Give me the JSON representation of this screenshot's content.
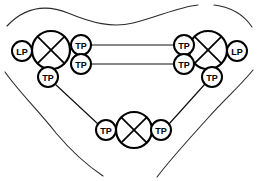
{
  "diagram": {
    "colors": {
      "background": "#ffffff",
      "node_stroke": "#000000",
      "link_stroke": "#111111",
      "boundary_stroke": "#2b2b2b"
    },
    "labels": {
      "lp": "LP",
      "tp": "TP"
    },
    "big_nodes": [
      {
        "id": "node-left",
        "cx": 51,
        "cy": 50,
        "r": 19,
        "icon": "crossed-circle-icon"
      },
      {
        "id": "node-right",
        "cx": 208,
        "cy": 50,
        "r": 19,
        "icon": "crossed-circle-icon"
      },
      {
        "id": "node-bottom",
        "cx": 134,
        "cy": 130,
        "r": 18,
        "icon": "crossed-circle-icon"
      }
    ],
    "small_nodes": [
      {
        "id": "lp-left",
        "label": "LP",
        "cx": 22,
        "cy": 51,
        "r": 10
      },
      {
        "id": "lp-right",
        "label": "LP",
        "cx": 237,
        "cy": 51,
        "r": 10
      },
      {
        "id": "tp-left-upper",
        "label": "TP",
        "cx": 81,
        "cy": 45,
        "r": 10
      },
      {
        "id": "tp-left-lower",
        "label": "TP",
        "cx": 81,
        "cy": 64,
        "r": 10
      },
      {
        "id": "tp-left-down",
        "label": "TP",
        "cx": 48,
        "cy": 77,
        "r": 10
      },
      {
        "id": "tp-right-upper",
        "label": "TP",
        "cx": 184,
        "cy": 45,
        "r": 10
      },
      {
        "id": "tp-right-lower",
        "label": "TP",
        "cx": 184,
        "cy": 64,
        "r": 10
      },
      {
        "id": "tp-right-down",
        "label": "TP",
        "cx": 212,
        "cy": 77,
        "r": 10
      },
      {
        "id": "tp-bottom-left",
        "label": "TP",
        "cx": 106,
        "cy": 130,
        "r": 10
      },
      {
        "id": "tp-bottom-right",
        "label": "TP",
        "cx": 161,
        "cy": 130,
        "r": 10
      }
    ],
    "links": [
      {
        "id": "link-top",
        "x1": 91,
        "y1": 45,
        "x2": 174,
        "y2": 45
      },
      {
        "id": "link-bottom",
        "x1": 91,
        "y1": 64,
        "x2": 174,
        "y2": 64
      },
      {
        "id": "link-left-diag",
        "x1": 55,
        "y1": 84,
        "x2": 98,
        "y2": 124
      },
      {
        "id": "link-right-diag",
        "x1": 205,
        "y1": 84,
        "x2": 169,
        "y2": 124
      }
    ],
    "boundaries": [
      {
        "id": "boundary-top-left",
        "d": "M 7 26 C 26 6 48 5 68 13 C 92 23 112 28 133 23 C 158 17 178 7 198 5"
      },
      {
        "id": "boundary-top-right",
        "d": "M 214 5 C 231 7 244 15 252 27"
      },
      {
        "id": "boundary-left",
        "d": "M 5 72 C 19 92 38 110 56 133 C 72 152 88 166 103 176"
      },
      {
        "id": "boundary-right",
        "d": "M 253 70 C 240 86 224 100 208 118 C 188 140 170 160 157 177"
      }
    ]
  }
}
